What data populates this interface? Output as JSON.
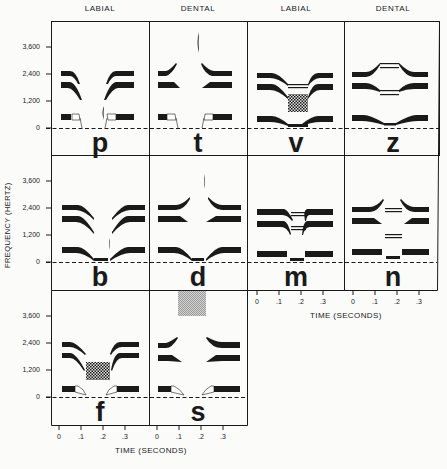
{
  "column_headers": [
    "LABIAL",
    "DENTAL",
    "LABIAL",
    "DENTAL"
  ],
  "y_axis": {
    "label": "FREQUENCY (HERTZ)",
    "ticks": [
      "3,600",
      "2,400",
      "1,200",
      "0"
    ]
  },
  "x_axis": {
    "label": "TIME (SECONDS)",
    "ticks": [
      "0",
      ".1",
      ".2",
      ".3"
    ]
  },
  "panels": [
    {
      "letter": "p",
      "place": "LABIAL",
      "row": 1,
      "col": 1
    },
    {
      "letter": "t",
      "place": "DENTAL",
      "row": 1,
      "col": 2
    },
    {
      "letter": "v",
      "place": "LABIAL",
      "row": 1,
      "col": 3
    },
    {
      "letter": "z",
      "place": "DENTAL",
      "row": 1,
      "col": 4
    },
    {
      "letter": "b",
      "place": "LABIAL",
      "row": 2,
      "col": 1
    },
    {
      "letter": "d",
      "place": "DENTAL",
      "row": 2,
      "col": 2
    },
    {
      "letter": "m",
      "place": "LABIAL",
      "row": 2,
      "col": 3
    },
    {
      "letter": "n",
      "place": "DENTAL",
      "row": 2,
      "col": 4
    },
    {
      "letter": "f",
      "place": "LABIAL",
      "row": 3,
      "col": 1
    },
    {
      "letter": "s",
      "place": "DENTAL",
      "row": 3,
      "col": 2
    }
  ],
  "colors": {
    "ink": "#1a1a1a",
    "paper": "#fbfbfa",
    "noise_gray": "#b8b8b8"
  }
}
